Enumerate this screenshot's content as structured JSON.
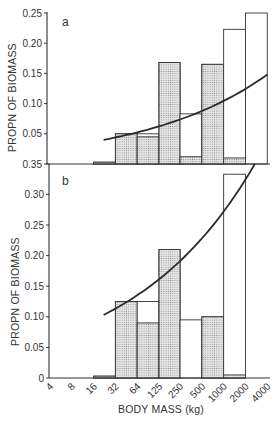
{
  "chart_data": [
    {
      "panel": "a",
      "type": "bar",
      "title": "",
      "xlabel": "BODY MASS (kg)",
      "ylabel": "PROPN OF BIOMASS",
      "ylim": [
        0,
        0.25
      ],
      "yticks": [
        "0.35",
        "0.05",
        "0.10",
        "0.15",
        "0.20",
        "0.25"
      ],
      "ytick_values": [
        0,
        0.05,
        0.1,
        0.15,
        0.2,
        0.25
      ],
      "x_scale": "log2",
      "x_ticks": [
        "4",
        "8",
        "16",
        "32",
        "64",
        "125",
        "250",
        "500",
        "1000",
        "2000",
        "4000"
      ],
      "bins": [
        "16-32",
        "32-64",
        "64-125",
        "125-250",
        "250-500",
        "500-1000",
        "1000-2000",
        "2000-4000"
      ],
      "series": [
        {
          "name": "open (total)",
          "fill": "none",
          "values": [
            0.003,
            0.05,
            0.05,
            0.168,
            0.083,
            0.165,
            0.223,
            0.25
          ]
        },
        {
          "name": "shaded",
          "fill": "stipple",
          "values": [
            0.003,
            0.05,
            0.045,
            0.168,
            0.012,
            0.165,
            0.01,
            0
          ]
        }
      ],
      "fitted_curve": {
        "x_start_kg": 22,
        "x_end_kg": 4000,
        "y_start": 0.04,
        "y_end": 0.148,
        "shape": "increasing convex"
      },
      "grid": false,
      "legend": null
    },
    {
      "panel": "b",
      "type": "bar",
      "title": "",
      "xlabel": "BODY MASS (kg)",
      "ylabel": "PROPN OF BIOMASS",
      "ylim": [
        0,
        0.35
      ],
      "yticks": [
        "0",
        "0.05",
        "0.10",
        "0.15",
        "0.20",
        "0.25",
        "0.30",
        "0.35"
      ],
      "ytick_values": [
        0,
        0.05,
        0.1,
        0.15,
        0.2,
        0.25,
        0.3,
        0.35
      ],
      "x_scale": "log2",
      "x_ticks": [
        "4",
        "8",
        "16",
        "32",
        "64",
        "125",
        "250",
        "500",
        "1000",
        "2000",
        "4000"
      ],
      "bins": [
        "16-32",
        "32-64",
        "64-125",
        "125-250",
        "250-500",
        "500-1000",
        "1000-2000",
        "2000-4000"
      ],
      "series": [
        {
          "name": "open (total)",
          "fill": "none",
          "values": [
            0.003,
            0.125,
            0.125,
            0.21,
            0.095,
            0.1,
            0.333,
            0
          ]
        },
        {
          "name": "shaded",
          "fill": "stipple",
          "values": [
            0.003,
            0.125,
            0.09,
            0.21,
            0,
            0.1,
            0.005,
            0
          ]
        }
      ],
      "fitted_curve": {
        "x_start_kg": 22,
        "x_end_kg": 2700,
        "y_start": 0.103,
        "y_end": 0.35,
        "shape": "increasing convex, exits top"
      },
      "grid": false,
      "legend": null
    }
  ],
  "figure": {
    "panel_a_label": "a",
    "panel_b_label": "b",
    "ylabel_a": "PROPN OF BIOMASS",
    "ylabel_b": "PROPN OF BIOMASS",
    "xlabel": "BODY MASS (kg)",
    "colors": {
      "ink": "#333333",
      "stipple_bg": "#e4e4e4",
      "stipple_dot": "#8a8a8a"
    }
  }
}
